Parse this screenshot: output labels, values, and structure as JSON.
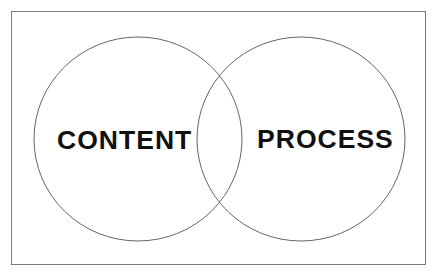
{
  "diagram": {
    "type": "venn",
    "frame": {
      "border_color": "#7a7a7a"
    },
    "circles": [
      {
        "id": "content",
        "label": "CONTENT",
        "cx": 138,
        "cy": 139,
        "rx": 104,
        "ry": 102,
        "stroke": "#666666"
      },
      {
        "id": "process",
        "label": "PROCESS",
        "cx": 301,
        "cy": 139,
        "rx": 104,
        "ry": 102,
        "stroke": "#666666"
      }
    ],
    "overlap_label": "",
    "text_color": "#111111"
  }
}
